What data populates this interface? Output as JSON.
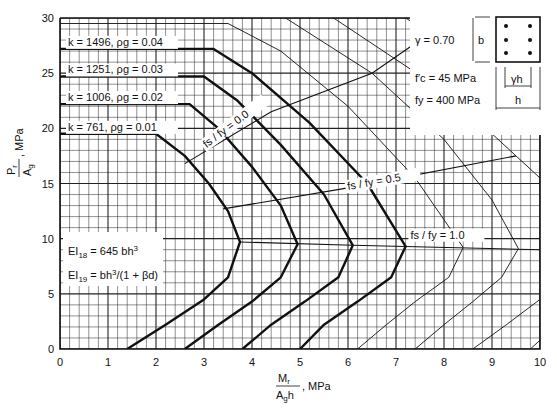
{
  "chart_data": {
    "type": "line",
    "title": "",
    "xlabel": "M_r / (A_g h), MPa",
    "ylabel": "P_r / A_g, MPa",
    "xlim": [
      0,
      10
    ],
    "ylim": [
      0,
      30
    ],
    "xticks": [
      "0",
      "1",
      "2",
      "3",
      "4",
      "5",
      "6",
      "7",
      "8",
      "9",
      "10"
    ],
    "yticks": [
      "0",
      "5",
      "10",
      "15",
      "20",
      "25",
      "30"
    ],
    "grid": true,
    "series": [
      {
        "name": "k = 761, ρg = 0.01",
        "label_k": "k =  761,",
        "label_rho": "ρg = 0.01",
        "weight": "thick",
        "points": [
          [
            0,
            19.5
          ],
          [
            2.0,
            19.5
          ],
          [
            2.6,
            17.5
          ],
          [
            3.1,
            15
          ],
          [
            3.5,
            12.5
          ],
          [
            3.75,
            9.7
          ],
          [
            3.5,
            6.5
          ],
          [
            3.0,
            4.5
          ],
          [
            2.2,
            2.2
          ],
          [
            1.4,
            0
          ]
        ]
      },
      {
        "name": "k = 1006, ρg = 0.02",
        "label_k": "k = 1006,",
        "label_rho": "ρg = 0.02",
        "weight": "thick",
        "points": [
          [
            0,
            22.2
          ],
          [
            2.7,
            22.2
          ],
          [
            3.3,
            20
          ],
          [
            4.0,
            16.5
          ],
          [
            4.6,
            13
          ],
          [
            4.95,
            9.5
          ],
          [
            4.6,
            6.5
          ],
          [
            4.0,
            4.3
          ],
          [
            3.3,
            2.2
          ],
          [
            2.6,
            0
          ]
        ]
      },
      {
        "name": "k = 1251, ρg = 0.03",
        "label_k": "k = 1251,",
        "label_rho": "ρg = 0.03",
        "weight": "thick",
        "points": [
          [
            0,
            24.7
          ],
          [
            3.0,
            24.7
          ],
          [
            3.7,
            22.5
          ],
          [
            4.6,
            18.5
          ],
          [
            5.5,
            14
          ],
          [
            6.1,
            9.4
          ],
          [
            5.8,
            6.5
          ],
          [
            5.1,
            4.3
          ],
          [
            4.4,
            2.2
          ],
          [
            3.8,
            0
          ]
        ]
      },
      {
        "name": "k = 1496, ρg = 0.04",
        "label_k": "k = 1496,",
        "label_rho": "ρg = 0.04",
        "weight": "thick",
        "points": [
          [
            0,
            27.2
          ],
          [
            3.2,
            27.2
          ],
          [
            4.0,
            25
          ],
          [
            5.2,
            20.5
          ],
          [
            6.4,
            15
          ],
          [
            7.2,
            9.3
          ],
          [
            6.9,
            6.5
          ],
          [
            6.2,
            4.3
          ],
          [
            5.5,
            2.2
          ],
          [
            5.0,
            0
          ]
        ]
      },
      {
        "name": "ρg = 0.05",
        "weight": "thin",
        "points": [
          [
            0,
            29.5
          ],
          [
            3.5,
            29.5
          ],
          [
            4.6,
            27
          ],
          [
            6.0,
            22
          ],
          [
            7.4,
            15.5
          ],
          [
            8.4,
            9.2
          ],
          [
            8.1,
            6.5
          ],
          [
            7.4,
            4.3
          ],
          [
            6.8,
            2.2
          ],
          [
            6.2,
            0
          ]
        ]
      },
      {
        "name": "ρg = 0.06",
        "weight": "thin",
        "points": [
          [
            4.7,
            30
          ],
          [
            6.5,
            25
          ],
          [
            8.0,
            19
          ],
          [
            9.0,
            13.5
          ],
          [
            9.55,
            9.1
          ],
          [
            9.2,
            6.5
          ],
          [
            8.6,
            4.3
          ],
          [
            8.0,
            2.2
          ],
          [
            7.4,
            0
          ]
        ]
      },
      {
        "name": "ρg = 0.07",
        "weight": "thin",
        "points": [
          [
            5.7,
            30
          ],
          [
            7.6,
            24.5
          ],
          [
            9.0,
            19.5
          ],
          [
            10,
            15.5
          ]
        ]
      },
      {
        "name": "ρg = 0.07 lower",
        "weight": "thin",
        "points": [
          [
            8.6,
            0
          ],
          [
            9.3,
            2.2
          ],
          [
            10,
            4.5
          ]
        ]
      },
      {
        "name": "ρg = 0.08",
        "weight": "thin",
        "points": [
          [
            7.2,
            30
          ],
          [
            8.5,
            26.5
          ],
          [
            10,
            22
          ]
        ]
      },
      {
        "name": "ρg = 0.08 lower",
        "weight": "thin",
        "points": [
          [
            9.8,
            0
          ],
          [
            10,
            0.8
          ]
        ]
      }
    ],
    "stress_lines": [
      {
        "name": "fs / fy = 0.0",
        "label": "fs / fy = 0.0",
        "points": [
          [
            2.6,
            16.8
          ],
          [
            4.4,
            21.5
          ],
          [
            6.5,
            25
          ],
          [
            8.0,
            29.5
          ]
        ]
      },
      {
        "name": "fs / fy = 0.5",
        "label": "fs / fy = 0.5",
        "points": [
          [
            3.4,
            12.7
          ],
          [
            6.0,
            14.6
          ],
          [
            9.5,
            17.5
          ]
        ]
      },
      {
        "name": "fs / fy = 1.0",
        "label": "fs / fy = 1.0",
        "points": [
          [
            3.75,
            9.7
          ],
          [
            6.1,
            9.4
          ],
          [
            10,
            9.0
          ]
        ]
      }
    ],
    "annotations": {
      "gamma": "γ  =  0.70",
      "fc": "f′c  =   45  MPa",
      "fy": "fy  =  400  MPa",
      "b": "b",
      "gamma_h": "γh",
      "h": "h",
      "ei18_a": "EI",
      "ei18_sub": "18",
      "ei18_b": " =  645 bh",
      "ei18_sup": "3",
      "ei19_a": "EI",
      "ei19_sub": "19",
      "ei19_b": " =  bh",
      "ei19_sup": "3",
      "ei19_c": "/(1 + βd)"
    }
  },
  "axis": {
    "x_num": "M",
    "x_num_sub": "r",
    "x_den": "A",
    "x_den_sub": "g",
    "x_den_tail": "h",
    "x_unit": ", MPa",
    "y_num": "P",
    "y_num_sub": "r",
    "y_den": "A",
    "y_den_sub": "g",
    "y_unit": ", MPa"
  }
}
